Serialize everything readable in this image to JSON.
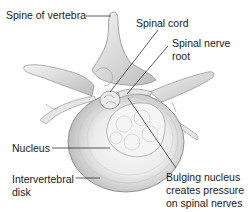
{
  "diagram": {
    "type": "anatomical-illustration",
    "labels": {
      "spine_of_vertebra": "Spine of vertebra",
      "spinal_cord": "Spinal cord",
      "spinal_nerve_root_line1": "Spinal nerve",
      "spinal_nerve_root_line2": "root",
      "nucleus": "Nucleus",
      "intervertebral_disk_line1": "Intervertebral",
      "intervertebral_disk_line2": "disk",
      "bulging_line1": "Bulging nucleus",
      "bulging_line2": "creates pressure",
      "bulging_line3": "on spinal nerves"
    },
    "colors": {
      "bone_light": "#f2f2f2",
      "bone_mid": "#d4d4d4",
      "bone_dark": "#8c8c8c",
      "leader_line": "#333333",
      "text": "#1a1a1a"
    }
  }
}
